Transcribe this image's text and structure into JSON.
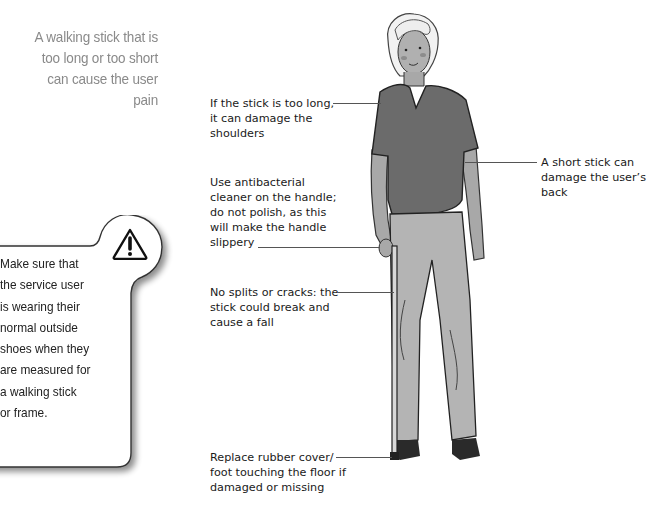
{
  "intro_text": {
    "lines": [
      "A walking stick that is",
      "too long or too short",
      "can cause the user",
      "pain"
    ]
  },
  "warning_callout": {
    "icon": "warning-triangle-icon",
    "lines": [
      "Make sure that",
      "the service user",
      "is wearing their",
      "normal outside",
      "shoes when they",
      "are measured for",
      "a walking stick",
      "or frame."
    ]
  },
  "annotations": [
    {
      "id": "too-long",
      "lines": [
        "If the stick is too long,",
        "it can damage the",
        "shoulders"
      ]
    },
    {
      "id": "cleaner",
      "lines": [
        "Use antibacterial",
        "cleaner on the handle;",
        "do not polish, as this",
        "will make the handle",
        "slippery"
      ]
    },
    {
      "id": "splits",
      "lines": [
        "No splits or cracks: the",
        "stick could break and",
        "cause a fall"
      ]
    },
    {
      "id": "rubber-foot",
      "lines": [
        "Replace rubber cover/",
        "foot touching the floor if",
        "damaged or missing"
      ]
    },
    {
      "id": "too-short",
      "lines": [
        "A short stick can",
        "damage the user’s",
        "back"
      ]
    }
  ],
  "colors": {
    "intro_text": "#8a8a8a",
    "shirt": "#6b6b6b",
    "trousers": "#b4b4b4",
    "skin": "#a8a8a8",
    "leader_line": "#555555"
  }
}
